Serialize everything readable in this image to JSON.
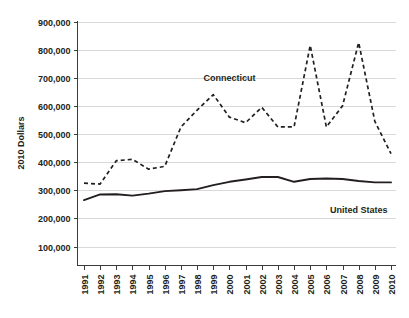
{
  "chart_data": {
    "type": "line",
    "title": "",
    "subtitle": "",
    "xlabel": "",
    "ylabel": "2010 Dollars",
    "x": [
      1991,
      1992,
      1993,
      1994,
      1995,
      1996,
      1997,
      1998,
      1999,
      2000,
      2001,
      2002,
      2003,
      2004,
      2005,
      2006,
      2007,
      2008,
      2009,
      2010
    ],
    "categories": [
      "1991",
      "1992",
      "1993",
      "1994",
      "1995",
      "1996",
      "1997",
      "1998",
      "1999",
      "2000",
      "2001",
      "2002",
      "2003",
      "2004",
      "2005",
      "2006",
      "2007",
      "2008",
      "2009",
      "2010"
    ],
    "ylim": [
      0,
      900000
    ],
    "xlim": [
      1991,
      2010
    ],
    "yticks": [
      100000,
      200000,
      300000,
      400000,
      500000,
      600000,
      700000,
      800000,
      900000
    ],
    "ytick_labels": [
      "100,000",
      "200,000",
      "300,000",
      "400,000",
      "500,000",
      "600,000",
      "700,000",
      "800,000",
      "900,000"
    ],
    "grid": true,
    "legend_position": "inline-annotation",
    "series": [
      {
        "name": "Connecticut",
        "style": "dashed",
        "color": "#231f20",
        "label_x": 2000,
        "label_y": 700000,
        "values": [
          325000,
          322000,
          405000,
          410000,
          375000,
          385000,
          525000,
          585000,
          640000,
          560000,
          540000,
          595000,
          525000,
          525000,
          815000,
          525000,
          600000,
          825000,
          545000,
          430000
        ]
      },
      {
        "name": "United States",
        "style": "solid",
        "color": "#231f20",
        "label_x": 2008,
        "label_y": 230000,
        "values": [
          265000,
          285000,
          286000,
          281000,
          288000,
          297000,
          300000,
          304000,
          318000,
          330000,
          338000,
          347000,
          347000,
          330000,
          340000,
          342000,
          340000,
          333000,
          328000,
          328000
        ]
      }
    ],
    "annotations": [
      {
        "text": "Connecticut",
        "series": "Connecticut"
      },
      {
        "text": "United States",
        "series": "United States"
      }
    ]
  }
}
